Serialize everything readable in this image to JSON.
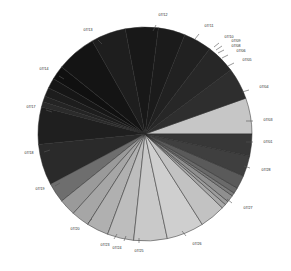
{
  "chart_data": {
    "type": "pie",
    "title": "",
    "subtitle": "",
    "xlabel": "",
    "ylabel": "",
    "legend": "none",
    "grid": false,
    "label_style": "outside-with-leader-ticks",
    "start_angle_deg": 0,
    "direction": "counterclockwise",
    "center": {
      "x": 145,
      "y": 134
    },
    "radius": 107,
    "categories": [
      "07/02",
      "07/01",
      "07/31",
      "07/30",
      "07/29",
      "07/28",
      "07/27",
      "07/26",
      "07/25",
      "07/24",
      "07/23",
      "07/22",
      "07/21",
      "07/20",
      "07/19",
      "07/18",
      "07/17",
      "07/16",
      "07/15",
      "07/14",
      "07/13",
      "07/12",
      "07/11",
      "07/10",
      "07/09",
      "07/08",
      "07/07",
      "07/06",
      "07/05",
      "07/04",
      "07/03"
    ],
    "labels_visible": [
      "07/12",
      "07/11",
      "07/10",
      "07/09",
      "07/08",
      "07/06",
      "07/05",
      "07/04",
      "07/03",
      "07/01",
      "07/28",
      "07/27",
      "07/26",
      "07/25",
      "07/24",
      "07/23",
      "07/20",
      "07/19",
      "07/18",
      "07/17",
      "07/14",
      "07/13"
    ],
    "series_name": "Share by date",
    "values": [
      5.6,
      4.9,
      4.6,
      4.4,
      4.2,
      5.1,
      5.4,
      6.2,
      2.2,
      1.6,
      1.4,
      0.9,
      0.8,
      5.8,
      6.4,
      3.1,
      2.6,
      2.8,
      3.4,
      4.1,
      5.2,
      5.8,
      4.0,
      0.7,
      0.6,
      1.1,
      0.5,
      0.9,
      2.1,
      3.2,
      3.4
    ],
    "slices": [
      {
        "label": "07/01",
        "value": 4.9,
        "start_deg": 5.6,
        "sweep_deg": 4.9,
        "color": "#2f2f2f",
        "label_x": 268,
        "label_y": 128,
        "tick_out": 9
      },
      {
        "label": "07/31",
        "value": 4.6,
        "start_deg": 10.5,
        "sweep_deg": 4.6,
        "color": "#262626",
        "label_x": 268,
        "label_y": 128,
        "tick_out": 9
      },
      {
        "label": "07/03",
        "value": 3.4,
        "start_deg": -0.6,
        "sweep_deg": 3.4,
        "color": "#333333",
        "label_x": 268,
        "label_y": 100,
        "tick_out": 9
      }
    ],
    "slice_colors": [
      "#c6c6c6",
      "#2e2e2e",
      "#272727",
      "#212121",
      "#1b1b1b",
      "#181818",
      "#1e1e1e",
      "#141414",
      "#101010",
      "#161616",
      "#1d1d1d",
      "#242424",
      "#2b2b2b",
      "#1f1f1f",
      "#2a2a2a",
      "#6e6e6e",
      "#9a9a9a",
      "#a6a6a6",
      "#b0b0b0",
      "#bdbdbd",
      "#c9c9c9",
      "#cfcfcf",
      "#c2c2c2",
      "#a8a8a8",
      "#9c9c9c",
      "#8f8f8f",
      "#7d7d7d",
      "#6a6a6a",
      "#5a5a5a",
      "#3f3f3f",
      "#373737"
    ],
    "value_axis_note": "percent of total",
    "total": 100
  },
  "chart": {
    "labels": [
      {
        "text": "07/12",
        "x": 163,
        "y": 16,
        "tx1": 156,
        "ty1": 25,
        "tx2": 153,
        "ty2": 31
      },
      {
        "text": "07/11",
        "x": 209,
        "y": 27,
        "tx1": 199,
        "ty1": 34,
        "tx2": 195,
        "ty2": 39
      },
      {
        "text": "07/10",
        "x": 229,
        "y": 38,
        "tx1": 219,
        "ty1": 43,
        "tx2": 214,
        "ty2": 47
      },
      {
        "text": "07/09",
        "x": 236,
        "y": 42,
        "tx1": 222,
        "ty1": 46,
        "tx2": 216,
        "ty2": 50
      },
      {
        "text": "07/08",
        "x": 236,
        "y": 47,
        "tx1": 224,
        "ty1": 50,
        "tx2": 218,
        "ty2": 53
      },
      {
        "text": "07/06",
        "x": 241,
        "y": 52,
        "tx1": 228,
        "ty1": 55,
        "tx2": 222,
        "ty2": 58
      },
      {
        "text": "07/05",
        "x": 247,
        "y": 61,
        "tx1": 234,
        "ty1": 63,
        "tx2": 228,
        "ty2": 66
      },
      {
        "text": "07/04",
        "x": 264,
        "y": 88,
        "tx1": 249,
        "ty1": 90,
        "tx2": 242,
        "ty2": 92
      },
      {
        "text": "07/03",
        "x": 268,
        "y": 121,
        "tx1": 253,
        "ty1": 121,
        "tx2": 246,
        "ty2": 121
      },
      {
        "text": "07/01",
        "x": 268,
        "y": 143,
        "tx1": 253,
        "ty1": 142,
        "tx2": 246,
        "ty2": 142
      },
      {
        "text": "07/28",
        "x": 266,
        "y": 171,
        "tx1": 250,
        "ty1": 168,
        "tx2": 244,
        "ty2": 166
      },
      {
        "text": "07/27",
        "x": 248,
        "y": 209,
        "tx1": 232,
        "ty1": 203,
        "tx2": 227,
        "ty2": 199
      },
      {
        "text": "07/26",
        "x": 197,
        "y": 245,
        "tx1": 186,
        "ty1": 236,
        "tx2": 182,
        "ty2": 231
      },
      {
        "text": "07/25",
        "x": 139,
        "y": 252,
        "tx1": 139,
        "ty1": 243,
        "tx2": 139,
        "ty2": 238
      },
      {
        "text": "07/24",
        "x": 117,
        "y": 249,
        "tx1": 124,
        "ty1": 241,
        "tx2": 126,
        "ty2": 236
      },
      {
        "text": "07/23",
        "x": 105,
        "y": 246,
        "tx1": 114,
        "ty1": 239,
        "tx2": 117,
        "ty2": 234
      },
      {
        "text": "07/20",
        "x": 75,
        "y": 230,
        "tx1": 88,
        "ty1": 223,
        "tx2": 92,
        "ty2": 219
      },
      {
        "text": "07/19",
        "x": 40,
        "y": 190,
        "tx1": 55,
        "ty1": 186,
        "tx2": 60,
        "ty2": 183
      },
      {
        "text": "07/18",
        "x": 29,
        "y": 154,
        "tx1": 44,
        "ty1": 152,
        "tx2": 50,
        "ty2": 150
      },
      {
        "text": "07/17",
        "x": 31,
        "y": 108,
        "tx1": 46,
        "ty1": 110,
        "tx2": 52,
        "ty2": 112
      },
      {
        "text": "07/14",
        "x": 44,
        "y": 70,
        "tx1": 59,
        "ty1": 76,
        "tx2": 64,
        "ty2": 79
      },
      {
        "text": "07/13",
        "x": 88,
        "y": 31,
        "tx1": 98,
        "ty1": 40,
        "tx2": 102,
        "ty2": 44
      }
    ]
  }
}
